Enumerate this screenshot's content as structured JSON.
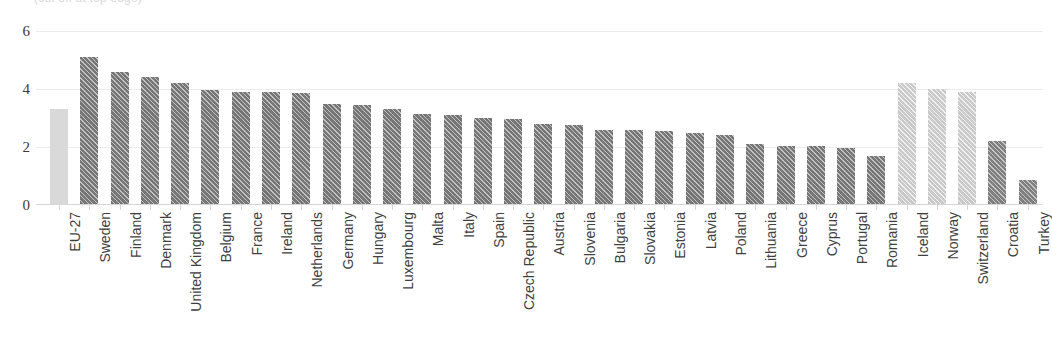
{
  "chart_data": {
    "type": "bar",
    "title": "",
    "title_fragment_visible": "(cut off at top edge)",
    "xlabel": "",
    "ylabel": "",
    "ylim": [
      0,
      6
    ],
    "yticks": [
      0,
      2,
      4,
      6
    ],
    "ytick_labels": [
      "0",
      "2",
      "4",
      "6"
    ],
    "grid": true,
    "legend": "none",
    "categories": [
      "EU-27",
      "Sweden",
      "Finland",
      "Denmark",
      "United Kingdom",
      "Belgium",
      "France",
      "Ireland",
      "Netherlands",
      "Germany",
      "Hungary",
      "Luxembourg",
      "Malta",
      "Italy",
      "Spain",
      "Czech Republic",
      "Austria",
      "Slovenia",
      "Bulgaria",
      "Slovakia",
      "Estonia",
      "Latvia",
      "Poland",
      "Lithuania",
      "Greece",
      "Cyprus",
      "Portugal",
      "Romania",
      "Iceland",
      "Norway",
      "Switzerland",
      "Croatia",
      "Turkey"
    ],
    "values": [
      3.3,
      5.1,
      4.6,
      4.4,
      4.2,
      3.95,
      3.9,
      3.9,
      3.85,
      3.5,
      3.45,
      3.3,
      3.15,
      3.1,
      3.0,
      2.95,
      2.8,
      2.75,
      2.6,
      2.6,
      2.55,
      2.5,
      2.4,
      2.1,
      2.05,
      2.05,
      1.95,
      1.7,
      4.2,
      4.0,
      3.9,
      2.2,
      0.85
    ],
    "bar_styles": [
      "aggregate",
      "member",
      "member",
      "member",
      "member",
      "member",
      "member",
      "member",
      "member",
      "member",
      "member",
      "member",
      "member",
      "member",
      "member",
      "member",
      "member",
      "member",
      "member",
      "member",
      "member",
      "member",
      "member",
      "member",
      "member",
      "member",
      "member",
      "member",
      "efta",
      "efta",
      "efta",
      "candidate",
      "candidate"
    ],
    "colors": {
      "aggregate": "#d9d9d9",
      "member": "#767676",
      "efta": "#c9c9c9",
      "candidate": "#7f7f7f",
      "gridline": "#ececec",
      "axis": "#d6d6d6",
      "text": "#3f3f3f"
    }
  }
}
